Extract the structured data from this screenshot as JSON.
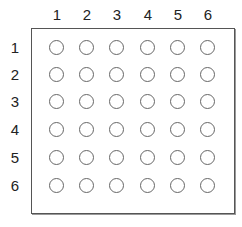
{
  "grid": {
    "columns": [
      "1",
      "2",
      "3",
      "4",
      "5",
      "6"
    ],
    "rows": [
      "1",
      "2",
      "3",
      "4",
      "5",
      "6"
    ],
    "cell_state": "empty",
    "border_color": "#555555",
    "circle_color": "#666666"
  }
}
